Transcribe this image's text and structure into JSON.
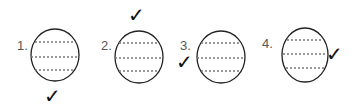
{
  "figure": {
    "items": [
      {
        "label": "1.",
        "check_position": "below",
        "check": "✓"
      },
      {
        "label": "2.",
        "check_position": "above",
        "check": "✓"
      },
      {
        "label": "3.",
        "check_position": "left",
        "check": "✓"
      },
      {
        "label": "4.",
        "check_position": "right",
        "check": "✓"
      }
    ],
    "colors": {
      "stroke": "#222222",
      "dash": "#777777",
      "label": "#555555"
    }
  }
}
